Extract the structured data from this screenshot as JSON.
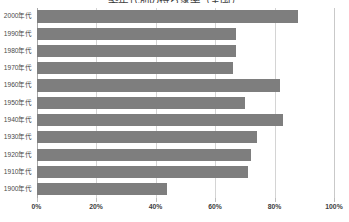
{
  "chart_data": {
    "type": "bar",
    "orientation": "horizontal",
    "title": "築年代別の持ち家率（全国）",
    "xlabel": "",
    "ylabel": "",
    "categories": [
      "2000年代",
      "1990年代",
      "1980年代",
      "1970年代",
      "1960年代",
      "1950年代",
      "1940年代",
      "1930年代",
      "1920年代",
      "1910年代",
      "1900年代"
    ],
    "values": [
      88,
      67,
      67,
      66,
      82,
      70,
      83,
      74,
      72,
      71,
      44
    ],
    "xlim": [
      0,
      100
    ],
    "xticks": [
      0,
      20,
      40,
      60,
      80,
      100
    ],
    "xtick_labels": [
      "0%",
      "20%",
      "40%",
      "60%",
      "80%",
      "100%"
    ],
    "grid": true,
    "legend": false,
    "bar_color": "#7e7e7e",
    "gridline_color": "#d4d4d4",
    "axis_color": "#a8a8a8",
    "background": "#ffffff"
  }
}
